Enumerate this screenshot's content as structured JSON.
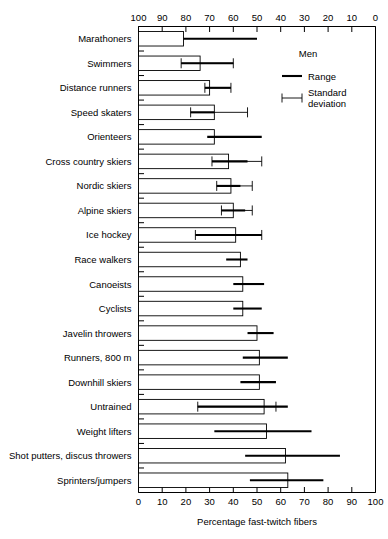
{
  "chart_data": {
    "type": "bar",
    "title": "",
    "subtitle": "",
    "xlabel": "Percentage fast-twitch fibers",
    "ylabel": "",
    "xlim": [
      0,
      100
    ],
    "grid": false,
    "orientation": "horizontal",
    "top_axis": {
      "reversed": true,
      "ticks": [
        100,
        90,
        80,
        70,
        60,
        50,
        40,
        30,
        20,
        10,
        0
      ],
      "tick_labels": [
        "100",
        "90",
        "80",
        "70",
        "60",
        "50",
        "40",
        "30",
        "20",
        "10",
        "0"
      ]
    },
    "bottom_axis": {
      "reversed": false,
      "ticks": [
        0,
        10,
        20,
        30,
        40,
        50,
        60,
        70,
        80,
        90,
        100
      ],
      "tick_labels": [
        "0",
        "10",
        "20",
        "30",
        "40",
        "50",
        "60",
        "70",
        "80",
        "90",
        "100"
      ]
    },
    "categories": [
      "Marathoners",
      "Swimmers",
      "Distance runners",
      "Speed skaters",
      "Orienteers",
      "Cross country skiers",
      "Nordic skiers",
      "Alpine skiers",
      "Ice hockey",
      "Race walkers",
      "Canoeists",
      "Cyclists",
      "Javelin throwers",
      "Runners, 800 m",
      "Downhill skiers",
      "Untrained",
      "Weight lifters",
      "Shot putters, discus throwers",
      "Sprinters/jumpers"
    ],
    "values": [
      19,
      26,
      30,
      32,
      32,
      38,
      39,
      40,
      41,
      43,
      44,
      44,
      50,
      51,
      51,
      53,
      54,
      62,
      63
    ],
    "range_low": [
      19,
      18,
      28,
      22,
      29,
      31,
      33,
      35,
      24,
      37,
      40,
      40,
      46,
      44,
      43,
      25,
      32,
      45,
      47
    ],
    "range_high": [
      50,
      40,
      39,
      32,
      52,
      46,
      43,
      45,
      52,
      46,
      53,
      52,
      57,
      63,
      58,
      63,
      73,
      85,
      78
    ],
    "sd_low": [
      null,
      18,
      28,
      22,
      null,
      31,
      33,
      35,
      24,
      null,
      null,
      null,
      null,
      null,
      null,
      25,
      null,
      null,
      null
    ],
    "sd_high": [
      null,
      40,
      39,
      46,
      null,
      52,
      48,
      48,
      52,
      null,
      null,
      null,
      null,
      null,
      null,
      58,
      null,
      null,
      null
    ],
    "has_sd": [
      false,
      true,
      true,
      true,
      false,
      true,
      true,
      true,
      true,
      false,
      false,
      false,
      false,
      false,
      false,
      true,
      false,
      false,
      false
    ],
    "series": [
      {
        "name": "Bar",
        "values": [
          19,
          26,
          30,
          32,
          32,
          38,
          39,
          40,
          41,
          43,
          44,
          44,
          50,
          51,
          51,
          53,
          54,
          62,
          63
        ]
      },
      {
        "name": "Range",
        "low": [
          19,
          18,
          28,
          22,
          29,
          31,
          33,
          35,
          24,
          37,
          40,
          40,
          46,
          44,
          43,
          25,
          32,
          45,
          47
        ],
        "high": [
          50,
          40,
          39,
          32,
          52,
          46,
          43,
          45,
          52,
          46,
          53,
          52,
          57,
          63,
          58,
          63,
          73,
          85,
          78
        ]
      }
    ]
  },
  "legend": {
    "position": "top-right",
    "title": "Men",
    "items": [
      {
        "label": "Range",
        "marker": "thick-line"
      },
      {
        "label": "Standard deviation",
        "label_line1": "Standard",
        "label_line2": "deviation",
        "marker": "error-bar"
      }
    ]
  },
  "colors": {
    "background": "#ffffff",
    "ink": "#000000",
    "bar_fill": "#ffffff"
  }
}
